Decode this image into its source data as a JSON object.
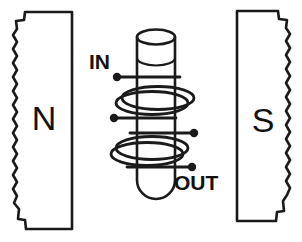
{
  "figure": {
    "background_color": "#ffffff",
    "ink_color": "#1a1a1a",
    "width": 302,
    "height": 242
  },
  "magnets": {
    "left": {
      "pole_label": "N",
      "pole_name": "north-pole",
      "edge_style": "jagged-broken-edge",
      "edge_side": "left"
    },
    "right": {
      "pole_label": "S",
      "pole_name": "south-pole",
      "edge_style": "jagged-broken-edge",
      "edge_side": "right"
    }
  },
  "solenoid": {
    "core_name": "cylindrical-tube-core",
    "core_shape": "rounded-bottom-cylinder",
    "coil_turns": 4,
    "terminals": [
      {
        "id": "in-upper",
        "label": "IN",
        "side": "left"
      },
      {
        "id": "in-lower",
        "label": "",
        "side": "left"
      },
      {
        "id": "out-upper",
        "label": "",
        "side": "right"
      },
      {
        "id": "out-lower",
        "label": "OUT",
        "side": "right"
      }
    ]
  },
  "labels": {
    "input": "IN",
    "output": "OUT",
    "north": "N",
    "south": "S"
  }
}
